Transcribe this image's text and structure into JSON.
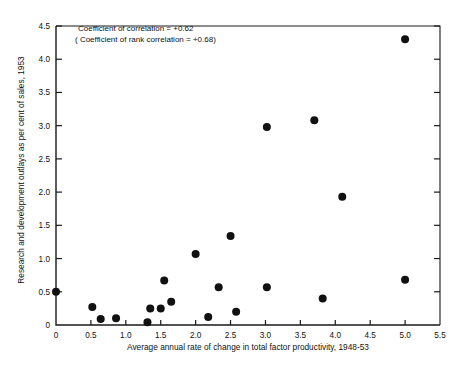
{
  "chart_data": {
    "type": "scatter",
    "title": "",
    "xlabel": "Average annual rate of change in total factor productivity, 1948-53",
    "ylabel": "Research and development outlays as per cent of sales, 1953",
    "xlim": [
      0,
      5.5
    ],
    "ylim": [
      0,
      4.5
    ],
    "xticks": [
      "0",
      "0.5",
      "1.0",
      "1.5",
      "2.0",
      "2.5",
      "3.0",
      "3.5",
      "4.0",
      "4.5",
      "5.0",
      "5.5"
    ],
    "xtickvalues": [
      0,
      0.5,
      1.0,
      1.5,
      2.0,
      2.5,
      3.0,
      3.5,
      4.0,
      4.5,
      5.0,
      5.5
    ],
    "yticks": [
      "0",
      "0.5",
      "1.0",
      "1.5",
      "2.0",
      "2.5",
      "3.0",
      "3.5",
      "4.0",
      "4.5"
    ],
    "ytickvalues": [
      0,
      0.5,
      1.0,
      1.5,
      2.0,
      2.5,
      3.0,
      3.5,
      4.0,
      4.5
    ],
    "grid": false,
    "legend": "none",
    "points": [
      {
        "x": 0.0,
        "y": 0.5
      },
      {
        "x": 0.52,
        "y": 0.27
      },
      {
        "x": 0.64,
        "y": 0.09
      },
      {
        "x": 0.86,
        "y": 0.1
      },
      {
        "x": 1.31,
        "y": 0.04
      },
      {
        "x": 1.35,
        "y": 0.25
      },
      {
        "x": 1.5,
        "y": 0.25
      },
      {
        "x": 1.55,
        "y": 0.67
      },
      {
        "x": 1.65,
        "y": 0.35
      },
      {
        "x": 2.0,
        "y": 1.07
      },
      {
        "x": 2.18,
        "y": 0.12
      },
      {
        "x": 2.33,
        "y": 0.57
      },
      {
        "x": 2.5,
        "y": 1.34
      },
      {
        "x": 2.58,
        "y": 0.2
      },
      {
        "x": 3.02,
        "y": 0.57
      },
      {
        "x": 3.02,
        "y": 2.98
      },
      {
        "x": 3.7,
        "y": 3.08
      },
      {
        "x": 3.82,
        "y": 0.4
      },
      {
        "x": 4.1,
        "y": 1.93
      },
      {
        "x": 5.0,
        "y": 0.68
      },
      {
        "x": 5.0,
        "y": 4.3
      }
    ],
    "annotations": [
      "Coefficient of correlation = +0.62",
      "( Coefficient of rank correlation = +0.68)"
    ],
    "colors": {
      "marker": "#111111",
      "axis": "#1a1a1a",
      "background": "#ffffff"
    }
  }
}
